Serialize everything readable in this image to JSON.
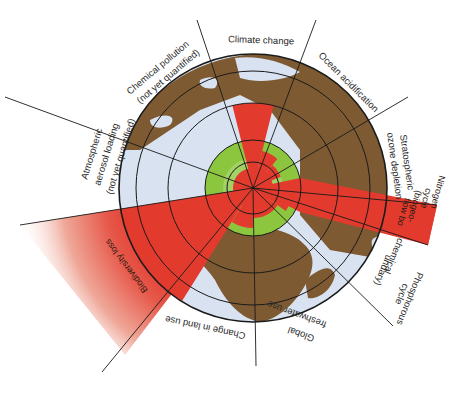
{
  "colors": {
    "land": "#7d5a32",
    "ocean": "#d8e2f0",
    "ocean_shade": "#c6d3e8",
    "safe_zone": "#8cc63f",
    "safe_zone_light": "#b8dc8a",
    "exceeded": "#e23b2e",
    "exceeded_fade": "#f3c9c0",
    "lines": "#1a1a1a",
    "label_text": "#2a2a2a"
  },
  "center": {
    "x": 253,
    "y": 188
  },
  "rings": [
    26,
    48,
    85,
    117
  ],
  "globe_radius": 134,
  "safe_zone_radius": 48,
  "boundaries": [
    {
      "id": "climate-change",
      "label": "Climate change",
      "value_radius": 85,
      "status": "exceeded"
    },
    {
      "id": "ocean-acidification",
      "label": "Ocean acidification",
      "value_radius": 38,
      "status": "within"
    },
    {
      "id": "stratospheric-ozone-depletion",
      "label": "Stratospheric ozone depletion",
      "label_lines": [
        "Stratospheric",
        "ozone depletion"
      ],
      "value_radius": 20,
      "status": "within"
    },
    {
      "id": "nitrogen-cycle",
      "label": "Nitrogen cycle (biogeochemical flow boundary)",
      "label_lines": [
        "Nitrogen",
        "cycle",
        "(biogeo-",
        "flow bo"
      ],
      "value_radius": 195,
      "status": "exceeded"
    },
    {
      "id": "phosphorus-cycle",
      "label": "Phosphorous cycle",
      "label_lines": [
        "Phosphorous",
        "cycle"
      ],
      "value_radius": 40,
      "status": "within"
    },
    {
      "id": "biogeochemical-flow-boundary",
      "label": "(biogeochemical flow boundary)",
      "label_lines": [
        "chemical",
        "undary)"
      ]
    },
    {
      "id": "global-freshwater-use",
      "label": "Global freshwater use",
      "label_lines": [
        "Global",
        "freshwater use"
      ],
      "value_radius": 30,
      "status": "within"
    },
    {
      "id": "change-in-land-use",
      "label": "Change in land use",
      "value_radius": 40,
      "status": "within"
    },
    {
      "id": "biodiversity-loss",
      "label": "Biodiversity loss",
      "value_radius": 240,
      "status": "exceeded"
    },
    {
      "id": "atmospheric-aerosol-loading",
      "label": "Atmospheric aerosol loading (not yet quantified)",
      "label_lines": [
        "Atmospheric",
        "aerosol loading",
        "(not yet quantified)"
      ],
      "status": "not-quantified"
    },
    {
      "id": "chemical-pollution",
      "label": "Chemical pollution (not yet quantified)",
      "label_lines": [
        "Chemical pollution",
        "(not yet quantified)"
      ],
      "status": "not-quantified"
    }
  ],
  "labels": {
    "climate": "Climate change",
    "ocean": "Ocean acidification",
    "ozone_1": "Stratospheric",
    "ozone_2": "ozone depletion",
    "nitrogen_1": "Nitrogen",
    "nitrogen_2": "cycle",
    "nitrogen_3": "(biogeo-",
    "nitrogen_4": "flow bo",
    "bio_1": "chemical",
    "bio_2": "undary)",
    "phos_1": "Phosphorous",
    "phos_2": "cycle",
    "fresh_1": "Global",
    "fresh_2": "freshwater use",
    "land": "Change in land use",
    "biodiv": "Biodiversity loss",
    "aerosol_1": "Atmospheric",
    "aerosol_2": "aerosol loading",
    "aerosol_3": "(not yet quantified)",
    "chem_1": "Chemical pollution",
    "chem_2": "(not yet quantified)"
  }
}
